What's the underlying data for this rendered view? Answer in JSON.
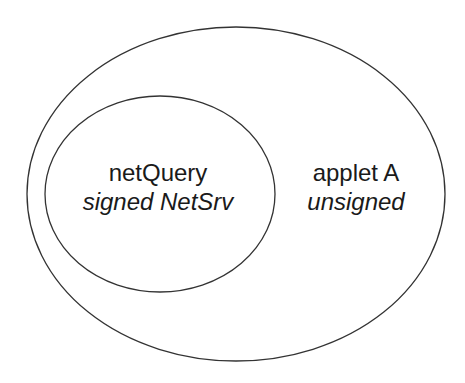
{
  "diagram": {
    "type": "nested-ellipses",
    "stroke_color": "#333333",
    "background": "#ffffff",
    "outer": {
      "name": "applet A",
      "subtitle": "unsigned",
      "label": {
        "title": "applet A",
        "subtitle": "unsigned"
      }
    },
    "inner": {
      "name": "netQuery",
      "subtitle": "signed NetSrv",
      "label": {
        "title": "netQuery",
        "subtitle": "signed NetSrv"
      }
    }
  }
}
